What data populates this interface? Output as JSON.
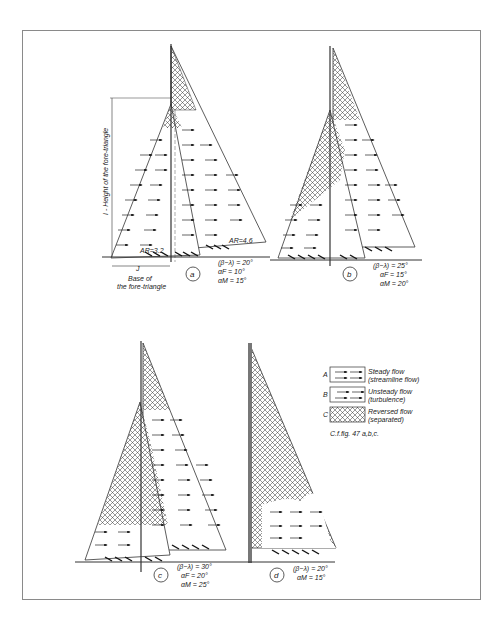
{
  "figure": {
    "panels": [
      {
        "id": "a",
        "circle_label": "a",
        "caption": [
          "(β−λ) = 20°",
          "αF = 10°",
          "αM = 15°"
        ],
        "jib_ar": "AR=3.2",
        "main_ar": "AR=4.6",
        "height_label": "I - Height of the fore-triangle",
        "base_label_1": "Base of",
        "base_label_2": "the fore-triangle",
        "base_symbol": "J"
      },
      {
        "id": "b",
        "circle_label": "b",
        "caption": [
          "(β−λ) = 25°",
          "αF = 15°",
          "αM = 20°"
        ]
      },
      {
        "id": "c",
        "circle_label": "c",
        "caption": [
          "(β−λ) = 30°",
          "αF = 20°",
          "αM = 25°"
        ]
      },
      {
        "id": "d",
        "circle_label": "d",
        "caption": [
          "(β−λ) = 20°",
          "αM = 15°"
        ]
      }
    ],
    "legend": {
      "items": [
        {
          "key": "A",
          "line1": "Steady flow",
          "line2": "(streamline flow)"
        },
        {
          "key": "B",
          "line1": "Unsteady flow",
          "line2": "(turbulence)"
        },
        {
          "key": "C",
          "line1": "Reversed flow",
          "line2": "(separated)"
        }
      ],
      "note": "C.f.fig. 47 a,b,c."
    }
  }
}
